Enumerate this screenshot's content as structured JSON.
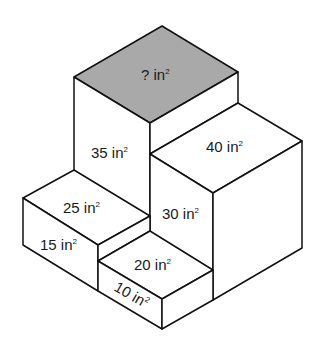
{
  "diagram": {
    "unit": "in",
    "colors": {
      "unknown_face": "#a9a9a9",
      "faces": "#ffffff",
      "edges": "#111111",
      "text": "#1a1a1a"
    },
    "labels": {
      "unknown": {
        "value": "?",
        "unit": " in",
        "exp": "2"
      },
      "tall_front": {
        "value": "35",
        "unit": " in",
        "exp": "2"
      },
      "right_top": {
        "value": "40",
        "unit": " in",
        "exp": "2"
      },
      "left_top": {
        "value": "25",
        "unit": " in",
        "exp": "2"
      },
      "right_side": {
        "value": "30",
        "unit": " in",
        "exp": "2"
      },
      "left_front": {
        "value": "15",
        "unit": " in",
        "exp": "2"
      },
      "small_top": {
        "value": "20",
        "unit": " in",
        "exp": "2"
      },
      "small_front": {
        "value": "10",
        "unit": " in",
        "exp": "2"
      }
    }
  }
}
